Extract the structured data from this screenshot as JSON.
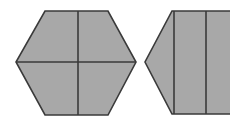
{
  "figure": {
    "canvas": {
      "width": 230,
      "height": 124,
      "background": "#ffffff"
    },
    "style": {
      "fill": "#a8a8a8",
      "stroke": "#3a3a3a",
      "stroke_width": 1.6
    },
    "shapes": [
      {
        "name": "left-hexagon",
        "kind": "hexagon",
        "points": "45,11 108,11 136,62 108,115 45,115 16,62",
        "dividers": [
          {
            "name": "vertical-divider",
            "x1": 78,
            "y1": 11,
            "x2": 78,
            "y2": 115
          },
          {
            "name": "horizontal-divider",
            "x1": 16,
            "y1": 62,
            "x2": 136,
            "y2": 62
          }
        ]
      },
      {
        "name": "right-hexagon-clipped",
        "kind": "hexagon-clipped-at-right-edge",
        "points": "172,11 231,11 231,114 172,114 145,62",
        "dividers": [
          {
            "name": "vertical-divider-left",
            "x1": 174,
            "y1": 11,
            "x2": 174,
            "y2": 114
          },
          {
            "name": "vertical-divider-right",
            "x1": 206,
            "y1": 11,
            "x2": 206,
            "y2": 114
          }
        ]
      }
    ]
  }
}
